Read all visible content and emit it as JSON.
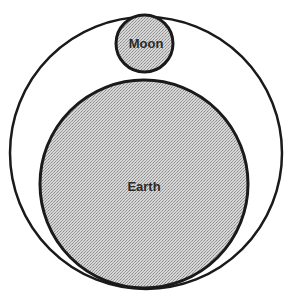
{
  "diagram": {
    "type": "nested-circles",
    "outer_circle": {
      "label": "",
      "cx": 146,
      "cy": 153,
      "r": 136
    },
    "earth": {
      "label": "Earth",
      "cx": 144,
      "cy": 184,
      "r": 104,
      "fill": "#c8c8c8"
    },
    "moon": {
      "label": "Moon",
      "cx": 144.5,
      "cy": 43.5,
      "r": 28.5,
      "fill": "#c8c8c8"
    },
    "stroke_color": "#1a1a1a",
    "caption": ""
  }
}
